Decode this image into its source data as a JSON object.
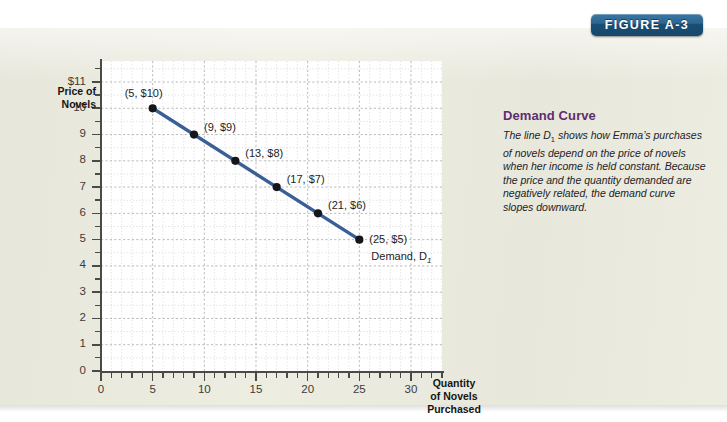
{
  "figure": {
    "badge_label": "FIGURE A-3",
    "badge_color": "#20608c"
  },
  "caption": {
    "title": "Demand Curve",
    "body_prefix": "The line D",
    "body_sub": "1",
    "body_rest": " shows how Emma’s purchases of novels depend on the price of novels when her income is held constant. Because the price and the quantity demanded are negatively related, the demand curve slopes downward."
  },
  "chart_data": {
    "type": "line",
    "title": "",
    "xlabel": "Quantity of Novels Purchased",
    "ylabel": "Price of Novels",
    "ylabel_line1": "Price of",
    "ylabel_line2": "Novels",
    "xlabel_line1": "Quantity",
    "xlabel_line2": "of Novels",
    "xlabel_line3": "Purchased",
    "xlim": [
      0,
      33
    ],
    "ylim": [
      0,
      11.8
    ],
    "grid": true,
    "legend_position": "inline-annotation",
    "series_name": "Demand, D1",
    "series_color": "#3a5f96",
    "x": [
      5,
      9,
      13,
      17,
      21,
      25
    ],
    "values": [
      10,
      9,
      8,
      7,
      6,
      5
    ],
    "point_labels": [
      "(5, $10)",
      "(9, $9)",
      "(13, $8)",
      "(17, $7)",
      "(21, $6)",
      "(25, $5)"
    ],
    "y_ticks": [
      0,
      1,
      2,
      3,
      4,
      5,
      6,
      7,
      8,
      9,
      10,
      11
    ],
    "y_tick_labels": [
      "0",
      "1",
      "2",
      "3",
      "4",
      "5",
      "6",
      "7",
      "8",
      "9",
      "10",
      "$11"
    ],
    "x_ticks": [
      0,
      5,
      10,
      15,
      20,
      25,
      30
    ],
    "x_tick_labels": [
      "0",
      "5",
      "10",
      "15",
      "20",
      "25",
      "30"
    ],
    "annotation": "Demand, D",
    "annotation_sub": "1"
  }
}
